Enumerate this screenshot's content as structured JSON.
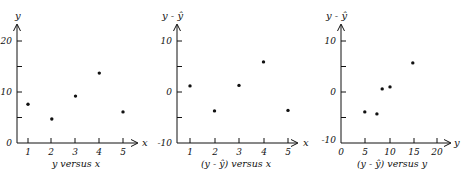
{
  "figure": {
    "ink_color": "#111111",
    "background": "#ffffff"
  },
  "chart_data": [
    {
      "type": "scatter",
      "title": "y versus x",
      "xlabel": "x",
      "ylabel": "y",
      "xlim": [
        0.5,
        5.5
      ],
      "ylim": [
        0,
        20
      ],
      "xticks": [
        1,
        2,
        3,
        4,
        5
      ],
      "yticks": [
        0,
        10,
        20
      ],
      "yticks_minor": [
        5,
        15
      ],
      "grid": false,
      "legend": null,
      "x": [
        1,
        2,
        3,
        4,
        5
      ],
      "y": [
        7.6,
        4.7,
        9.2,
        13.7,
        6.1
      ]
    },
    {
      "type": "scatter",
      "title": "(y - ŷ) versus x",
      "xlabel": "x",
      "ylabel": "y - ŷ",
      "xlim": [
        0.5,
        5.5
      ],
      "ylim": [
        -10,
        10
      ],
      "xticks": [
        1,
        2,
        3,
        4,
        5
      ],
      "yticks": [
        -10,
        0,
        10
      ],
      "yticks_minor": [
        -5,
        5
      ],
      "grid": false,
      "legend": null,
      "x": [
        1,
        2,
        3,
        4,
        5
      ],
      "y": [
        1.2,
        -3.7,
        1.3,
        5.9,
        -3.6
      ]
    },
    {
      "type": "scatter",
      "title": "(y - ŷ) versus y",
      "xlabel": "y",
      "ylabel": "y - ŷ",
      "xlim": [
        0,
        20
      ],
      "ylim": [
        -10,
        10
      ],
      "xticks": [
        0,
        5,
        10,
        15,
        20
      ],
      "yticks": [
        -10,
        0,
        10
      ],
      "yticks_minor": [
        -5,
        5
      ],
      "grid": false,
      "legend": null,
      "x": [
        4.9,
        7.4,
        8.5,
        10.1,
        14.8
      ],
      "y": [
        -3.9,
        -4.3,
        0.6,
        1.0,
        5.7
      ]
    }
  ],
  "panels": [
    {
      "caption": "y versus x",
      "x_axis_name": "x",
      "y_axis_name": "y",
      "y_tick_labels": [
        "20",
        "10",
        "0"
      ],
      "x_tick_labels": [
        "1",
        "2",
        "3",
        "4",
        "5"
      ]
    },
    {
      "caption": "(y - ŷ) versus x",
      "x_axis_name": "x",
      "y_axis_name": "y - ŷ",
      "y_tick_labels": [
        "10",
        "0",
        "-10"
      ],
      "x_tick_labels": [
        "1",
        "2",
        "3",
        "4",
        "5"
      ]
    },
    {
      "caption": "(y - ŷ) versus y",
      "x_axis_name": "y",
      "y_axis_name": "y - ŷ",
      "y_tick_labels": [
        "10",
        "0",
        "-10"
      ],
      "x_tick_labels": [
        "0",
        "5",
        "10",
        "15",
        "20"
      ]
    }
  ]
}
